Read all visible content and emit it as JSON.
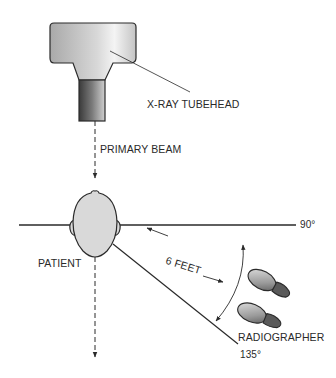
{
  "diagram": {
    "labels": {
      "tubehead": "X-RAY TUBEHEAD",
      "primary_beam": "PRIMARY BEAM",
      "patient": "PATIENT",
      "distance": "6 FEET",
      "radiographer": "RADIOGRAPHER",
      "angle_90": "90°",
      "angle_135": "135°"
    },
    "components": [
      {
        "id": "tubehead",
        "shape": "t-shaped housing with cylindrical cone"
      },
      {
        "id": "primary-beam",
        "shape": "dashed vertical arrow"
      },
      {
        "id": "patient-head",
        "shape": "top-down head outline with ears"
      },
      {
        "id": "line-90",
        "shape": "horizontal line through head"
      },
      {
        "id": "line-135",
        "shape": "diagonal line from head"
      },
      {
        "id": "distance-arrow",
        "shape": "double-headed arrow"
      },
      {
        "id": "arc-arrow",
        "shape": "curved double-headed arrow between 90° and 135°"
      },
      {
        "id": "footprints",
        "shape": "two shoe prints"
      }
    ],
    "colors": {
      "line": "#2a2a2a",
      "fill_light": "#d9d9d9",
      "fill_dark": "#555555"
    }
  }
}
